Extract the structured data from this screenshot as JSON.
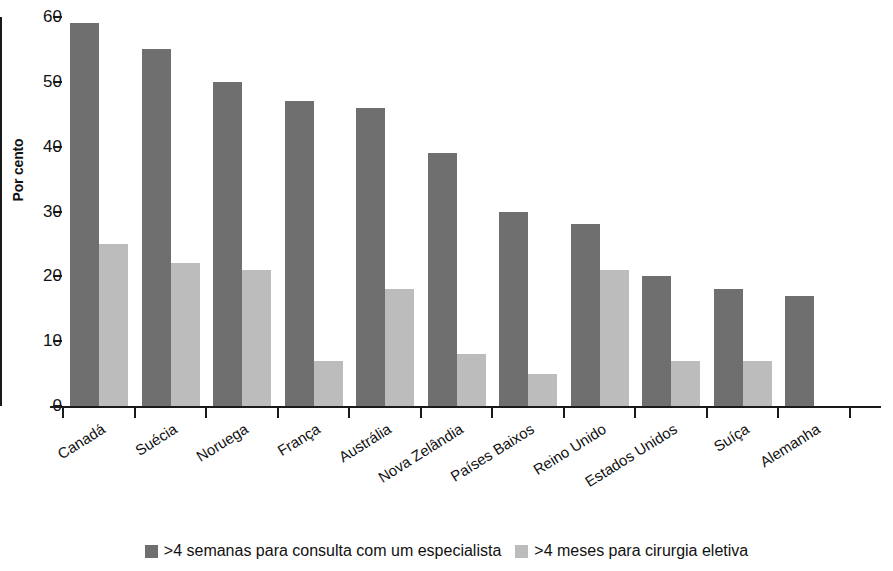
{
  "chart_data": {
    "type": "bar",
    "title": "",
    "subtitle": "",
    "xlabel": "",
    "ylabel": "Por cento",
    "ylim": [
      0,
      60
    ],
    "ytick_values": [
      60,
      50,
      40,
      30,
      20,
      10,
      0
    ],
    "ytick_labels": [
      "60",
      "50",
      "40",
      "30",
      "20",
      "10",
      "0"
    ],
    "grid": false,
    "legend_position": "bottom-center",
    "categories": [
      "Canadá",
      "Suécia",
      "Noruega",
      "França",
      "Austrália",
      "Nova Zelândia",
      "Países Baixos",
      "Reino Unido",
      "Estados Unidos",
      "Suíça",
      "Alemanha"
    ],
    "series": [
      {
        "name": ">4 semanas para consulta com um especialista",
        "color": "#6f6f6f",
        "values": [
          59,
          55,
          50,
          47,
          46,
          39,
          30,
          28,
          20,
          18,
          17
        ]
      },
      {
        "name": ">4 meses para cirurgia eletiva",
        "color": "#bcbcbc",
        "values": [
          25,
          22,
          21,
          7,
          18,
          8,
          5,
          21,
          7,
          7,
          null
        ]
      }
    ]
  },
  "legend": {
    "entries": [
      {
        "label": ">4 semanas para consulta com um especialista",
        "color": "#6f6f6f"
      },
      {
        "label": ">4 meses para cirurgia eletiva",
        "color": "#bcbcbc"
      }
    ]
  },
  "axes": {
    "y_title": "Por cento"
  }
}
